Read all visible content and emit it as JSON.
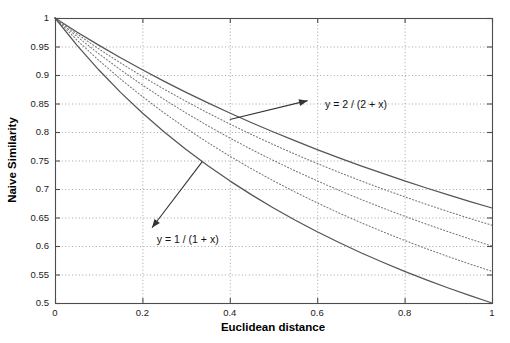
{
  "chart_data": {
    "type": "line",
    "title": "",
    "xlabel": "Euclidean distance",
    "ylabel": "Naive Similarity",
    "xlim": [
      0,
      1
    ],
    "ylim": [
      0.5,
      1
    ],
    "grid": true,
    "legend": "none",
    "xticks": [
      "0",
      "0.2",
      "0.4",
      "0.6",
      "0.8",
      "1"
    ],
    "xtick_values": [
      0,
      0.2,
      0.4,
      0.6,
      0.8,
      1
    ],
    "yticks": [
      "0.5",
      "0.55",
      "0.6",
      "0.65",
      "0.7",
      "0.75",
      "0.8",
      "0.85",
      "0.9",
      "0.95",
      "1"
    ],
    "ytick_values": [
      0.5,
      0.55,
      0.6,
      0.65,
      0.7,
      0.75,
      0.8,
      0.85,
      0.9,
      0.95,
      1
    ],
    "x": [
      0,
      0.05,
      0.1,
      0.15,
      0.2,
      0.25,
      0.3,
      0.35,
      0.4,
      0.45,
      0.5,
      0.55,
      0.6,
      0.65,
      0.7,
      0.75,
      0.8,
      0.85,
      0.9,
      0.95,
      1
    ],
    "series": [
      {
        "name": "y = 2 / (2 + x)",
        "style": "solid",
        "color": "#555555",
        "k": 2,
        "values": [
          1,
          0.9756,
          0.9524,
          0.9302,
          0.9091,
          0.8889,
          0.8696,
          0.8511,
          0.8333,
          0.8163,
          0.8,
          0.7843,
          0.7692,
          0.7547,
          0.7407,
          0.7273,
          0.7143,
          0.7018,
          0.6897,
          0.678,
          0.6667
        ]
      },
      {
        "name": "y = 1.75 / (1.75 + x)",
        "style": "dotted",
        "color": "#777777",
        "k": 1.75,
        "values": [
          1,
          0.9722,
          0.9459,
          0.9211,
          0.8974,
          0.875,
          0.8537,
          0.8333,
          0.814,
          0.7955,
          0.7778,
          0.7609,
          0.7447,
          0.7292,
          0.7143,
          0.7,
          0.6863,
          0.6731,
          0.6604,
          0.6481,
          0.6364
        ]
      },
      {
        "name": "y = 1.5 / (1.5 + x)",
        "style": "dotted",
        "color": "#777777",
        "k": 1.5,
        "values": [
          1,
          0.9677,
          0.9375,
          0.9091,
          0.8824,
          0.8571,
          0.8333,
          0.8108,
          0.7895,
          0.7692,
          0.75,
          0.7317,
          0.7143,
          0.6977,
          0.6818,
          0.6667,
          0.6522,
          0.6383,
          0.625,
          0.6122,
          0.6
        ]
      },
      {
        "name": "y = 1.25 / (1.25 + x)",
        "style": "dotted",
        "color": "#777777",
        "k": 1.25,
        "values": [
          1,
          0.9615,
          0.9259,
          0.8929,
          0.8621,
          0.8333,
          0.8065,
          0.7813,
          0.7576,
          0.7353,
          0.7143,
          0.6944,
          0.6757,
          0.6579,
          0.641,
          0.625,
          0.6098,
          0.5952,
          0.5814,
          0.5682,
          0.5556
        ]
      },
      {
        "name": "y = 1 / (1 + x)",
        "style": "solid",
        "color": "#555555",
        "k": 1,
        "values": [
          1,
          0.9524,
          0.9091,
          0.8696,
          0.8333,
          0.8,
          0.7692,
          0.7407,
          0.7143,
          0.6897,
          0.6667,
          0.6452,
          0.625,
          0.6061,
          0.5882,
          0.5714,
          0.5556,
          0.5405,
          0.5263,
          0.5128,
          0.5
        ]
      }
    ],
    "annotations": [
      {
        "label": "y = 2 / (2 + x)",
        "text_x": 0.618,
        "text_y": 0.849,
        "arrow_from_x": 0.4,
        "arrow_from_y": 0.822,
        "arrow_to_x": 0.578,
        "arrow_to_y": 0.855
      },
      {
        "label": "y = 1 / (1 + x)",
        "text_x": 0.233,
        "text_y": 0.612,
        "arrow_from_x": 0.337,
        "arrow_from_y": 0.748,
        "arrow_to_x": 0.222,
        "arrow_to_y": 0.632
      }
    ]
  },
  "colors": {
    "axis": "#4d4d4d",
    "grid": "#9a9a9a",
    "curve_solid": "#555555",
    "curve_dotted": "#777777",
    "background": "#ffffff",
    "text": "#111111"
  }
}
